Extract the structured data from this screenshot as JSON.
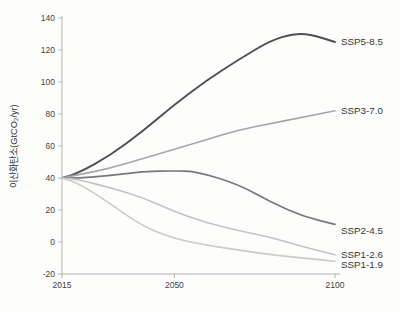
{
  "chart_data": {
    "type": "line",
    "title": "",
    "xlabel": "",
    "ylabel": "이산화탄소(GtCO₂/yr)",
    "xlim": [
      2015,
      2100
    ],
    "ylim": [
      -20,
      140
    ],
    "x_ticks": [
      "2015",
      "2050",
      "2100"
    ],
    "x_tick_years": [
      2015,
      2050,
      2100
    ],
    "y_ticks": [
      140,
      120,
      100,
      80,
      60,
      40,
      20,
      0,
      -20
    ],
    "grid": false,
    "legend_position": "right-end-labels",
    "colors": {
      "background": "#fdfdfc",
      "axis": "#b3b4b6",
      "tick_text": "#3f3f41",
      "label_text": "#353537",
      "ylabel_text": "#2e2e30"
    },
    "series": [
      {
        "name": "SSP5-8.5",
        "color": "#4e4f53",
        "width": 1.9,
        "label_dy": 0,
        "points": [
          [
            2015,
            40
          ],
          [
            2020,
            43
          ],
          [
            2030,
            54
          ],
          [
            2040,
            69
          ],
          [
            2050,
            86
          ],
          [
            2060,
            101
          ],
          [
            2070,
            114
          ],
          [
            2080,
            126
          ],
          [
            2087,
            130
          ],
          [
            2092,
            130
          ],
          [
            2100,
            125
          ]
        ]
      },
      {
        "name": "SSP3-7.0",
        "color": "#a6a6a8",
        "width": 1.6,
        "label_dy": 0,
        "points": [
          [
            2015,
            40
          ],
          [
            2020,
            42
          ],
          [
            2030,
            46
          ],
          [
            2040,
            52
          ],
          [
            2050,
            58
          ],
          [
            2060,
            64
          ],
          [
            2070,
            70
          ],
          [
            2080,
            74
          ],
          [
            2090,
            78
          ],
          [
            2100,
            82
          ]
        ]
      },
      {
        "name": "SSP2-4.5",
        "color": "#77787c",
        "width": 1.7,
        "label_dy": 6,
        "points": [
          [
            2015,
            40
          ],
          [
            2020,
            40
          ],
          [
            2030,
            41.5
          ],
          [
            2040,
            44
          ],
          [
            2050,
            44.5
          ],
          [
            2057,
            44
          ],
          [
            2070,
            36
          ],
          [
            2080,
            25
          ],
          [
            2090,
            16
          ],
          [
            2100,
            11
          ]
        ]
      },
      {
        "name": "SSP1-2.6",
        "color": "#c2c3c5",
        "width": 1.6,
        "label_dy": 0,
        "points": [
          [
            2015,
            40
          ],
          [
            2020,
            39
          ],
          [
            2030,
            34
          ],
          [
            2040,
            28
          ],
          [
            2050,
            19
          ],
          [
            2060,
            12
          ],
          [
            2070,
            7
          ],
          [
            2080,
            3
          ],
          [
            2090,
            -3
          ],
          [
            2100,
            -8
          ]
        ]
      },
      {
        "name": "SSP1-1.9",
        "color": "#cbccca",
        "width": 1.6,
        "label_dy": 4,
        "points": [
          [
            2015,
            40
          ],
          [
            2020,
            37
          ],
          [
            2030,
            24
          ],
          [
            2040,
            10
          ],
          [
            2050,
            2
          ],
          [
            2060,
            -2
          ],
          [
            2070,
            -5
          ],
          [
            2080,
            -8
          ],
          [
            2090,
            -10
          ],
          [
            2100,
            -12
          ]
        ]
      }
    ]
  }
}
